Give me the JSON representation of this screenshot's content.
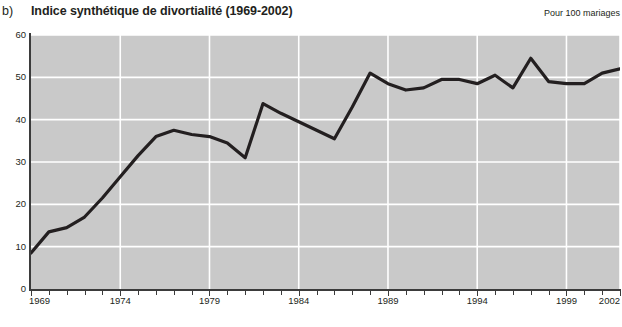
{
  "header": {
    "panel_letter": "b)",
    "title": "Indice synthétique de divortialité (1969-2002)",
    "unit_note": "Pour 100 mariages"
  },
  "colors": {
    "plot_background": "#c9c9c9",
    "gridline": "#ffffff",
    "line": "#231f20",
    "axis": "#3b3b3b",
    "page_background": "#ffffff"
  },
  "chart_data": {
    "type": "line",
    "title": "Indice synthétique de divortialité (1969-2002)",
    "subtitle": "",
    "xlabel": "",
    "ylabel": "Pour 100 mariages",
    "ylim": [
      0,
      60
    ],
    "xlim": [
      1969,
      2002
    ],
    "yticks": [
      0,
      10,
      20,
      30,
      40,
      50,
      60
    ],
    "ytick_labels": [
      "0",
      "10",
      "20",
      "30",
      "40",
      "50",
      "60"
    ],
    "xticks": [
      1969,
      1974,
      1979,
      1984,
      1989,
      1994,
      1999,
      2002
    ],
    "xtick_labels": [
      "1969",
      "1974",
      "1979",
      "1984",
      "1989",
      "1994",
      "1999",
      "2002"
    ],
    "grid": true,
    "grid_axis": "both",
    "legend": false,
    "x": [
      1969,
      1970,
      1971,
      1972,
      1973,
      1974,
      1975,
      1976,
      1977,
      1978,
      1979,
      1980,
      1981,
      1982,
      1983,
      1984,
      1985,
      1986,
      1987,
      1988,
      1989,
      1990,
      1991,
      1992,
      1993,
      1994,
      1995,
      1996,
      1997,
      1998,
      1999,
      2000,
      2001,
      2002
    ],
    "values": [
      8.5,
      13.5,
      14.5,
      17.0,
      21.5,
      26.5,
      31.5,
      36.0,
      37.5,
      36.5,
      36.0,
      34.5,
      31.0,
      43.8,
      41.5,
      39.5,
      37.5,
      35.5,
      43.0,
      51.0,
      48.5,
      47.0,
      47.5,
      49.5,
      49.5,
      48.5,
      50.5,
      47.5,
      54.5,
      49.0,
      48.5,
      48.5,
      51.0,
      52.0
    ],
    "annotations": [
      {
        "label": "valeur initiale 1969",
        "x": 1969,
        "y": 8.5
      },
      {
        "label": "pic 1996",
        "x": 1996,
        "y": 54.5
      },
      {
        "label": "valeur finale 2002",
        "x": 2002,
        "y": 51.0
      }
    ]
  }
}
